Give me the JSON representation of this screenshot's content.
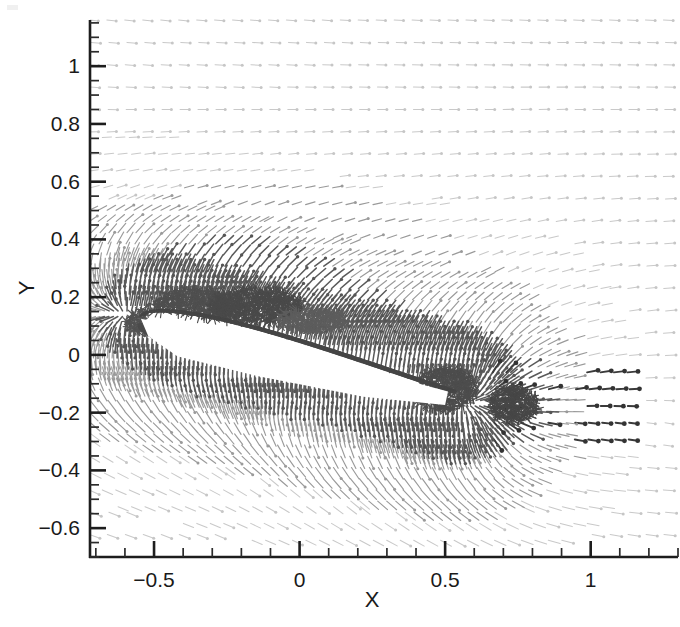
{
  "figure": {
    "title": "",
    "background_color": "#ffffff",
    "width": 680,
    "height": 627
  },
  "axes": {
    "x_title": "X",
    "y_title": "Y",
    "x_tick_labels": [
      "-0.5",
      "0",
      "0.5",
      "1"
    ],
    "y_tick_labels": [
      "1",
      "0.8",
      "0.6",
      "0.4",
      "0.2",
      "0",
      "-0.2",
      "-0.4",
      "-0.6"
    ],
    "tick_color": "#1d1d1d",
    "label_color": "#1a1a1a",
    "frame_style": "L-shaped (left and bottom spines only)"
  },
  "chart_data": {
    "type": "scatter",
    "plot_kind": "velocity-vector-field",
    "title": "",
    "xlabel": "X",
    "ylabel": "Y",
    "xlim": [
      -0.72,
      1.3
    ],
    "ylim": [
      -0.7,
      1.16
    ],
    "xticks": [
      -0.5,
      0,
      0.5,
      1
    ],
    "xticklabels": [
      "-0.5",
      "0",
      "0.5",
      "1"
    ],
    "yticks": [
      -0.6,
      -0.4,
      -0.2,
      0,
      0.2,
      0.4,
      0.6,
      0.8,
      1
    ],
    "yticklabels": [
      "-0.6",
      "-0.4",
      "-0.2",
      "0",
      "0.2",
      "0.4",
      "0.6",
      "0.8",
      "1"
    ],
    "x_minor_tick_interval": 0.1,
    "y_minor_tick_interval": 0.05,
    "grid": false,
    "legend": null,
    "legend_position": "none",
    "colors": {
      "freestream_vectors": "#c9c9c9",
      "near_field_vectors": "#9a9a9a",
      "separated_region_vectors": "#5a5a5a",
      "wake_highlight_vectors": "#3a3a3a",
      "body_fill": "#ffffff",
      "axis": "#1d1d1d"
    },
    "body": {
      "name": "inclined-flat-plate",
      "description": "White solid body (flat plate / thin airfoil) inclined nose-up-left, spanning the mid-field",
      "leading_edge": [
        -0.55,
        0.12
      ],
      "trailing_edge": [
        0.52,
        -0.145
      ],
      "angle_of_attack_deg": 14,
      "chord": 1.1
    },
    "flow_features": [
      {
        "name": "leading-edge-separation-bubble",
        "center": [
          -0.38,
          0.16
        ],
        "extent": [
          0.34,
          0.12
        ],
        "intensity": "dark"
      },
      {
        "name": "primary-suction-side-vortex",
        "center": [
          -0.18,
          0.155
        ],
        "extent": [
          0.3,
          0.13
        ],
        "intensity": "dark"
      },
      {
        "name": "shear-layer-upper-surface",
        "center": [
          0.05,
          0.06
        ],
        "extent": [
          0.7,
          0.05
        ],
        "intensity": "dark"
      },
      {
        "name": "trailing-edge-vortex",
        "center": [
          0.52,
          -0.13
        ],
        "extent": [
          0.22,
          0.14
        ],
        "intensity": "dark"
      },
      {
        "name": "near-wake-shedding-cluster",
        "center": [
          0.72,
          -0.165
        ],
        "extent": [
          0.18,
          0.12
        ],
        "intensity": "dark"
      },
      {
        "name": "wake-highlight-arrows",
        "center": [
          1.02,
          -0.22
        ],
        "extent": [
          0.34,
          0.14
        ],
        "intensity": "darkest"
      },
      {
        "name": "freestream-uniform-flow",
        "center": [
          0.4,
          0.85
        ],
        "extent": [
          1.8,
          0.6
        ],
        "intensity": "light"
      }
    ],
    "vector_field": {
      "freestream_direction_deg": -8,
      "description": "Arrows point predominantly in +X with a slight downward tilt in the far field; rows curve around the body, compressing beneath it and rolling up above the suction surface.",
      "sampling_rows": 96,
      "sampling_cols": 130
    }
  }
}
